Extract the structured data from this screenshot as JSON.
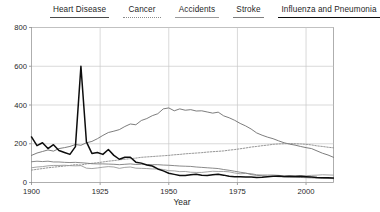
{
  "chart_data": {
    "type": "line",
    "title": "",
    "xlabel": "Year",
    "ylabel": "",
    "xlim": [
      1900,
      2010
    ],
    "ylim": [
      0,
      800
    ],
    "grid": true,
    "legend_position": "top",
    "xticks": [
      "1900",
      "1925",
      "1950",
      "1975",
      "2000"
    ],
    "xtick_values": [
      1900,
      1925,
      1950,
      1975,
      2000
    ],
    "yticks": [
      "0",
      "200",
      "400",
      "600",
      "800"
    ],
    "ytick_values": [
      0,
      200,
      400,
      600,
      800
    ],
    "x": [
      1900,
      1902,
      1904,
      1906,
      1908,
      1910,
      1912,
      1914,
      1916,
      1918,
      1920,
      1922,
      1924,
      1926,
      1928,
      1930,
      1932,
      1934,
      1936,
      1938,
      1940,
      1942,
      1944,
      1946,
      1948,
      1950,
      1952,
      1954,
      1956,
      1958,
      1960,
      1962,
      1964,
      1966,
      1968,
      1970,
      1972,
      1974,
      1976,
      1978,
      1980,
      1982,
      1984,
      1986,
      1988,
      1990,
      1992,
      1994,
      1996,
      1998,
      2000,
      2002,
      2004,
      2006,
      2008,
      2010
    ],
    "series": [
      {
        "name": "Heart Disease",
        "color": "#6e6e6e",
        "width": 0.9,
        "dash": "none",
        "values": [
          140,
          152,
          160,
          168,
          162,
          175,
          180,
          186,
          196,
          192,
          205,
          212,
          226,
          243,
          258,
          265,
          273,
          289,
          302,
          298,
          320,
          330,
          345,
          355,
          380,
          385,
          370,
          380,
          373,
          376,
          369,
          370,
          364,
          358,
          363,
          344,
          334,
          321,
          305,
          292,
          276,
          256,
          244,
          234,
          226,
          215,
          205,
          198,
          193,
          186,
          180,
          175,
          163,
          151,
          142,
          130
        ]
      },
      {
        "name": "Cancer",
        "color": "#8a8a8a",
        "width": 0.9,
        "dash": "dotted",
        "values": [
          64,
          68,
          72,
          76,
          79,
          82,
          85,
          88,
          92,
          90,
          96,
          99,
          102,
          106,
          110,
          113,
          117,
          120,
          123,
          126,
          130,
          132,
          134,
          136,
          138,
          140,
          143,
          145,
          148,
          150,
          152,
          154,
          157,
          159,
          161,
          163,
          167,
          170,
          174,
          178,
          183,
          186,
          190,
          193,
          197,
          199,
          200,
          201,
          200,
          199,
          197,
          194,
          189,
          186,
          182,
          179
        ]
      },
      {
        "name": "Accidents",
        "color": "#9a9a9a",
        "width": 0.9,
        "dash": "none",
        "values": [
          76,
          80,
          82,
          86,
          88,
          88,
          89,
          87,
          86,
          87,
          74,
          72,
          75,
          79,
          82,
          80,
          73,
          78,
          80,
          74,
          73,
          72,
          70,
          70,
          67,
          61,
          60,
          56,
          57,
          53,
          52,
          52,
          55,
          58,
          57,
          57,
          55,
          49,
          45,
          47,
          46,
          40,
          39,
          39,
          39,
          37,
          34,
          35,
          35,
          36,
          35,
          37,
          38,
          40,
          39,
          38
        ]
      },
      {
        "name": "Stroke",
        "color": "#7d7d7d",
        "width": 0.9,
        "dash": "none",
        "values": [
          107,
          110,
          108,
          110,
          106,
          106,
          104,
          103,
          104,
          102,
          100,
          97,
          96,
          96,
          95,
          94,
          92,
          94,
          96,
          93,
          94,
          93,
          92,
          92,
          90,
          89,
          87,
          85,
          84,
          83,
          80,
          78,
          76,
          74,
          72,
          67,
          63,
          58,
          53,
          49,
          41,
          37,
          35,
          33,
          32,
          30,
          29,
          28,
          27,
          26,
          25,
          24,
          23,
          22,
          21,
          20
        ]
      },
      {
        "name": "Influenza and Pneumonia",
        "color": "#0d0d0d",
        "width": 1.5,
        "dash": "none",
        "values": [
          235,
          190,
          205,
          175,
          195,
          165,
          155,
          145,
          185,
          600,
          210,
          150,
          155,
          145,
          170,
          140,
          120,
          130,
          130,
          105,
          100,
          90,
          85,
          70,
          60,
          48,
          42,
          36,
          36,
          40,
          42,
          38,
          36,
          40,
          43,
          38,
          32,
          30,
          30,
          29,
          28,
          26,
          27,
          30,
          32,
          33,
          31,
          32,
          31,
          32,
          30,
          28,
          26,
          25,
          24,
          23
        ]
      }
    ]
  },
  "legend": {
    "entries": [
      {
        "label": "Heart Disease",
        "color": "#4a4a4a",
        "style": "solid",
        "thickness": "1.3px",
        "width": "59px"
      },
      {
        "label": "Cancer",
        "color": "#8a8a8a",
        "style": "dotted",
        "thickness": "1.1px",
        "width": "38px"
      },
      {
        "label": "Accidents",
        "color": "#9a9a9a",
        "style": "solid",
        "thickness": "1px",
        "width": "44px"
      },
      {
        "label": "Stroke",
        "color": "#7d7d7d",
        "style": "solid",
        "thickness": "1px",
        "width": "31px"
      },
      {
        "label": "Influenza and Pneumonia",
        "color": "#0d0d0d",
        "style": "solid",
        "thickness": "1.6px",
        "width": "102px"
      }
    ]
  }
}
